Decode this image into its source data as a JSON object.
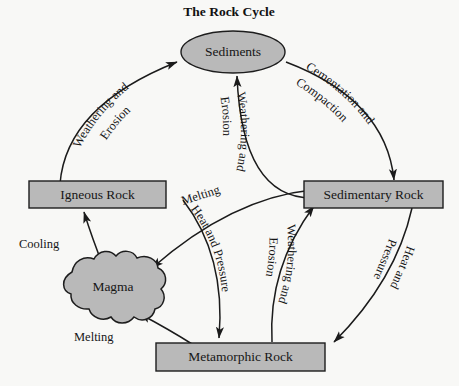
{
  "title": "The Rock Cycle",
  "colors": {
    "background": "#f8f8f6",
    "shape_fill": "#b9b9b9",
    "outline": "#1d1d1d",
    "text": "#161616"
  },
  "nodes": {
    "sediments": {
      "label": "Sediments",
      "shape": "ellipse"
    },
    "igneous": {
      "label": "Igneous Rock",
      "shape": "rectangle"
    },
    "sedimentary": {
      "label": "Sedimentary Rock",
      "shape": "rectangle"
    },
    "metamorphic": {
      "label": "Metamorphic Rock",
      "shape": "rectangle"
    },
    "magma": {
      "label": "Magma",
      "shape": "blob"
    }
  },
  "edges": [
    {
      "id": "igneous-to-sediments",
      "from": "Igneous Rock",
      "to": "Sediments",
      "label_line1": "Weathering and",
      "label_line2": "Erosion"
    },
    {
      "id": "sediments-to-sedimentary",
      "from": "Sediments",
      "to": "Sedimentary Rock",
      "label_line1": "Cementation and",
      "label_line2": "Compaction"
    },
    {
      "id": "sedimentary-to-sediments",
      "from": "Sedimentary Rock",
      "to": "Sediments",
      "label_line1": "Weathering and",
      "label_line2": "Erosion"
    },
    {
      "id": "sedimentary-to-metamorphic",
      "from": "Sedimentary Rock",
      "to": "Metamorphic Rock",
      "label_line1": "Heat and",
      "label_line2": "Pressure"
    },
    {
      "id": "metamorphic-to-sedimentary",
      "from": "Metamorphic Rock",
      "to": "Sedimentary Rock",
      "label_line1": "Weathering and",
      "label_line2": "Erosion"
    },
    {
      "id": "sedimentary-to-magma",
      "from": "Sedimentary Rock",
      "to": "Magma",
      "label_line1": "Melting",
      "label_line2": ""
    },
    {
      "id": "igneous-to-metamorphic",
      "from": "Igneous Rock",
      "to": "Metamorphic Rock",
      "label_line1": "Heat and Pressure",
      "label_line2": ""
    },
    {
      "id": "metamorphic-to-magma",
      "from": "Metamorphic Rock",
      "to": "Magma",
      "label_line1": "Melting",
      "label_line2": ""
    },
    {
      "id": "magma-to-igneous",
      "from": "Magma",
      "to": "Igneous Rock",
      "label_line1": "Cooling",
      "label_line2": ""
    }
  ],
  "labels": {
    "weathering_erosion_left_1": "Weathering and",
    "weathering_erosion_left_2": "Erosion",
    "cementation_1": "Cementation and",
    "cementation_2": "Compaction",
    "weathering_center_1": "Weathering and",
    "weathering_center_2": "Erosion",
    "melting_upper": "Melting",
    "heat_pressure_center": "Heat and Pressure",
    "weathering_lower_1": "Weathering and",
    "weathering_lower_2": "Erosion",
    "heat_pressure_right_1": "Heat and",
    "heat_pressure_right_2": "Pressure",
    "cooling": "Cooling",
    "melting_lower": "Melting"
  }
}
